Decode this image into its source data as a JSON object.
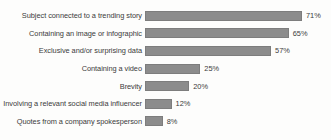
{
  "chart_data": {
    "type": "bar",
    "orientation": "horizontal",
    "title": "",
    "subtitle": "",
    "xlabel": "",
    "ylabel": "",
    "xlim": [
      0,
      71
    ],
    "grid": false,
    "legend": false,
    "bar_color": "#8c8c8c",
    "text_color": "#3b3b3b",
    "background_color": "#fdfdfc",
    "value_suffix": "%",
    "categories": [
      "Subject connected to a trending story",
      "Containing an image or infographic",
      "Exclusive and/or surprising data",
      "Containing a video",
      "Brevity",
      "Involving a relevant social media influencer",
      "Quotes from a company spokesperson"
    ],
    "values": [
      71,
      65,
      57,
      25,
      20,
      12,
      8
    ],
    "value_labels": [
      "71%",
      "65%",
      "57%",
      "25%",
      "20%",
      "12%",
      "8%"
    ]
  }
}
